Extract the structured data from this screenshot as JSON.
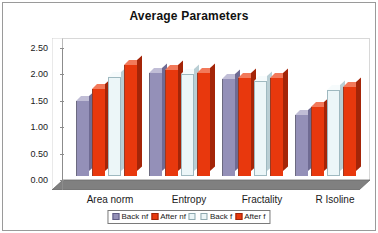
{
  "chart_data": {
    "type": "bar",
    "title": "Average Parameters",
    "xlabel": "",
    "ylabel": "",
    "ylim": [
      0.0,
      2.5
    ],
    "ytick_labels": [
      "2.50",
      "2.00",
      "1.50",
      "1.00",
      "0.50",
      "0.00"
    ],
    "ytick_values": [
      2.5,
      2.0,
      1.5,
      1.0,
      0.5,
      0.0
    ],
    "grid": false,
    "legend_position": "bottom",
    "style": "3d-clustered-column",
    "categories": [
      "Area norm",
      "Entropy",
      "Fractality",
      "R Isoline"
    ],
    "series": [
      {
        "name": "Back nf",
        "color": "#9490b8",
        "values": [
          1.42,
          1.96,
          1.83,
          1.15
        ]
      },
      {
        "name": "After nf",
        "color": "#e8380d",
        "values": [
          1.64,
          2.0,
          1.86,
          1.3
        ]
      },
      {
        "name": "Back f",
        "color": "#ecf6f8",
        "values": [
          1.88,
          1.93,
          1.8,
          1.62
        ]
      },
      {
        "name": "After f",
        "color": "#e8380d",
        "values": [
          2.1,
          1.96,
          1.85,
          1.69
        ]
      }
    ],
    "legend_entries": [
      {
        "label": "Back nf",
        "swatch": "purple"
      },
      {
        "label": "After nf",
        "swatch": "red"
      },
      {
        "label": "",
        "swatch": "white"
      },
      {
        "label": "Back f",
        "swatch": "white"
      },
      {
        "label": "After f",
        "swatch": "red"
      }
    ],
    "colors": {
      "series_purple": "#9490b8",
      "series_red": "#e8380d",
      "series_white": "#ecf6f8",
      "floor": "#808080",
      "wall": "#ffffff",
      "axis": "#8c8c8c",
      "border": "#9a9a9a",
      "text": "#1a1a1a"
    }
  }
}
